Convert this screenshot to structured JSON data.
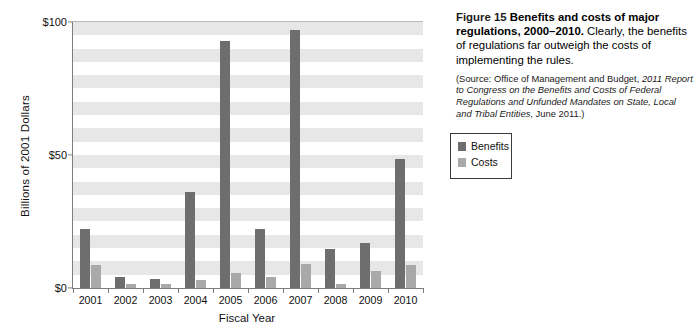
{
  "caption": {
    "figure_label": "Figure 15",
    "title": "Benefits and costs of major regulations, 2000–2010.",
    "body": "Clearly, the benefits of regulations far outweigh the costs of implementing the rules.",
    "source_prefix": "(Source:",
    "source_agency": " Office of Management and Budget, ",
    "source_doc": "2011 Report to Congress on the Benefits and Costs of Federal Regulations and Unfunded Mandates on State, Local and Tribal Entities",
    "source_suffix": ", June 2011.)"
  },
  "legend": {
    "items": [
      {
        "label": "Benefits",
        "color": "#6e6e6e"
      },
      {
        "label": "Costs",
        "color": "#a9a9a9"
      }
    ]
  },
  "axes": {
    "y_title": "Billions of 2001 Dollars",
    "x_title": "Fiscal Year",
    "y_ticks": [
      "$0",
      "$50",
      "$100"
    ]
  },
  "chart_data": {
    "type": "bar",
    "title": "Benefits and costs of major regulations, 2000–2010",
    "xlabel": "Fiscal Year",
    "ylabel": "Billions of 2001 Dollars",
    "ylim": [
      0,
      100
    ],
    "ytick_values": [
      0,
      50,
      100
    ],
    "ytick_labels": [
      "$0",
      "$50",
      "$100"
    ],
    "grid": "horizontal alternating shaded bands every 5 units",
    "legend_position": "right",
    "categories": [
      "2001",
      "2002",
      "2003",
      "2004",
      "2005",
      "2006",
      "2007",
      "2008",
      "2009",
      "2010"
    ],
    "series": [
      {
        "name": "Benefits",
        "color": "#6e6e6e",
        "values": [
          22,
          4,
          3.5,
          36,
          93,
          22,
          97,
          14.5,
          17,
          48.5
        ]
      },
      {
        "name": "Costs",
        "color": "#a9a9a9",
        "values": [
          8.5,
          1.5,
          1.5,
          3,
          5.5,
          4,
          9,
          1.5,
          6.5,
          8.5
        ]
      }
    ]
  }
}
